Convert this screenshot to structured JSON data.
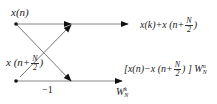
{
  "diagram": {
    "type": "butterfly",
    "title": "",
    "nodes": {
      "top_input": {
        "label_pre": "x(n)"
      },
      "bottom_input": {
        "label_pre": "x (n+",
        "frac_num": "N",
        "frac_den": "2",
        "label_post": ")"
      }
    },
    "outputs": {
      "top": {
        "label_pre": "x(k)+x (n+",
        "frac_num": "N",
        "frac_den": "2",
        "label_post": ")"
      },
      "bottom": {
        "label_pre": "[x(n)−x (n+",
        "frac_num": "N",
        "frac_den": "2",
        "label_post": ") ] W",
        "sup": "n",
        "sub": "N"
      }
    },
    "edge_labels": {
      "minus_one": "−1",
      "twiddle": {
        "base": "W",
        "sup": "k",
        "sub": "N"
      }
    },
    "colors": {
      "line": "#888888",
      "arrow": "#111111",
      "node": "#111111",
      "text": "#222222"
    }
  }
}
